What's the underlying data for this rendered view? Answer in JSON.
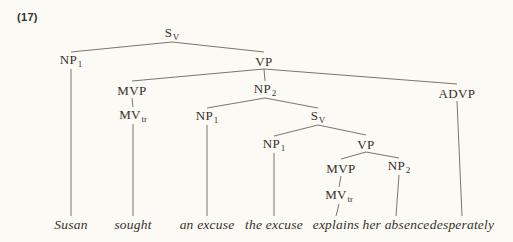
{
  "example_number": "(17)",
  "colors": {
    "background": "#fbfaf5",
    "ink": "#35302a",
    "edge_line": "#6b675f"
  },
  "tree": {
    "nodes": [
      {
        "id": "s_root",
        "name": "node-s-v-root",
        "type": "cat",
        "label": "S",
        "sub": "V",
        "x": 172,
        "y": 34
      },
      {
        "id": "np1_subj",
        "name": "node-np1-subject",
        "type": "cat",
        "label": "NP",
        "sub": "1",
        "x": 71,
        "y": 61
      },
      {
        "id": "vp_main",
        "name": "node-vp-main",
        "type": "cat",
        "label": "VP",
        "sub": "",
        "x": 264,
        "y": 61
      },
      {
        "id": "mvp_main",
        "name": "node-mvp-main",
        "type": "cat",
        "label": "MVP",
        "sub": "",
        "x": 132,
        "y": 90
      },
      {
        "id": "mvtr_main",
        "name": "node-mv-tr-main",
        "type": "cat",
        "label": "MV",
        "sub": "tr",
        "x": 133,
        "y": 116
      },
      {
        "id": "np2_main",
        "name": "node-np2-main",
        "type": "cat",
        "label": "NP",
        "sub": "2",
        "x": 265,
        "y": 90
      },
      {
        "id": "advp",
        "name": "node-advp",
        "type": "cat",
        "label": "ADVP",
        "sub": "",
        "x": 457,
        "y": 93
      },
      {
        "id": "np1_obj",
        "name": "node-np1-object",
        "type": "cat",
        "label": "NP",
        "sub": "1",
        "x": 207,
        "y": 117
      },
      {
        "id": "s_emb",
        "name": "node-s-v-embedded",
        "type": "cat",
        "label": "S",
        "sub": "V",
        "x": 318,
        "y": 117
      },
      {
        "id": "np1_emb",
        "name": "node-np1-embedded",
        "type": "cat",
        "label": "NP",
        "sub": "1",
        "x": 274,
        "y": 145
      },
      {
        "id": "vp_emb",
        "name": "node-vp-embedded",
        "type": "cat",
        "label": "VP",
        "sub": "",
        "x": 366,
        "y": 144
      },
      {
        "id": "mvp_emb",
        "name": "node-mvp-embedded",
        "type": "cat",
        "label": "MVP",
        "sub": "",
        "x": 341,
        "y": 168
      },
      {
        "id": "mvtr_emb",
        "name": "node-mv-tr-embedded",
        "type": "cat",
        "label": "MV",
        "sub": "tr",
        "x": 339,
        "y": 196
      },
      {
        "id": "np2_emb",
        "name": "node-np2-embedded",
        "type": "cat",
        "label": "NP",
        "sub": "2",
        "x": 399,
        "y": 167
      },
      {
        "id": "w_susan",
        "name": "word-susan",
        "type": "word",
        "label": "Susan",
        "sub": "",
        "x": 71,
        "y": 225
      },
      {
        "id": "w_sought",
        "name": "word-sought",
        "type": "word",
        "label": "sought",
        "sub": "",
        "x": 133,
        "y": 225
      },
      {
        "id": "w_an_excuse",
        "name": "word-an-excuse",
        "type": "word",
        "label": "an excuse",
        "sub": "",
        "x": 207,
        "y": 225
      },
      {
        "id": "w_the_excuse",
        "name": "word-the-excuse",
        "type": "word",
        "label": "the excuse",
        "sub": "",
        "x": 274,
        "y": 225
      },
      {
        "id": "w_explains",
        "name": "word-explains",
        "type": "word",
        "label": "explains",
        "sub": "",
        "x": 336,
        "y": 225
      },
      {
        "id": "w_her_absence",
        "name": "word-her-absence",
        "type": "word",
        "label": "her absence",
        "sub": "",
        "x": 396,
        "y": 225
      },
      {
        "id": "w_desperately",
        "name": "word-desperately",
        "type": "word",
        "label": "desperately",
        "sub": "",
        "x": 462,
        "y": 225
      }
    ],
    "edges": [
      {
        "from": "s_root",
        "to": "np1_subj"
      },
      {
        "from": "s_root",
        "to": "vp_main"
      },
      {
        "from": "vp_main",
        "to": "mvp_main"
      },
      {
        "from": "vp_main",
        "to": "np2_main"
      },
      {
        "from": "vp_main",
        "to": "advp"
      },
      {
        "from": "mvp_main",
        "to": "mvtr_main"
      },
      {
        "from": "mvtr_main",
        "to": "w_sought"
      },
      {
        "from": "np1_subj",
        "to": "w_susan"
      },
      {
        "from": "np2_main",
        "to": "np1_obj"
      },
      {
        "from": "np2_main",
        "to": "s_emb"
      },
      {
        "from": "np1_obj",
        "to": "w_an_excuse"
      },
      {
        "from": "s_emb",
        "to": "np1_emb"
      },
      {
        "from": "s_emb",
        "to": "vp_emb"
      },
      {
        "from": "np1_emb",
        "to": "w_the_excuse"
      },
      {
        "from": "vp_emb",
        "to": "mvp_emb"
      },
      {
        "from": "vp_emb",
        "to": "np2_emb"
      },
      {
        "from": "mvp_emb",
        "to": "mvtr_emb"
      },
      {
        "from": "mvtr_emb",
        "to": "w_explains"
      },
      {
        "from": "np2_emb",
        "to": "w_her_absence"
      },
      {
        "from": "advp",
        "to": "w_desperately"
      }
    ]
  }
}
